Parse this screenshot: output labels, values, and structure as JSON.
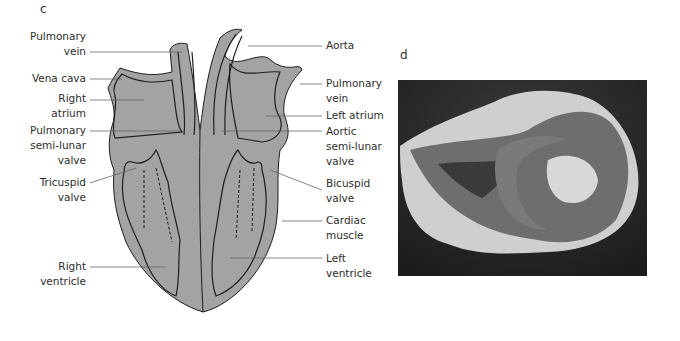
{
  "panels": {
    "c": {
      "letter": "c",
      "title": "Heart diagram (longitudinal section)",
      "labels_left": [
        {
          "id": "pulmonary-vein-left",
          "text": "Pulmonary\nvein"
        },
        {
          "id": "vena-cava",
          "text": "Vena cava"
        },
        {
          "id": "right-atrium",
          "text": "Right\natrium"
        },
        {
          "id": "pulmonary-semilunar-valve",
          "text": "Pulmonary\nsemi-lunar\nvalve"
        },
        {
          "id": "tricuspid-valve",
          "text": "Tricuspid\nvalve"
        },
        {
          "id": "right-ventricle",
          "text": "Right\nventricle"
        }
      ],
      "labels_right": [
        {
          "id": "aorta",
          "text": "Aorta"
        },
        {
          "id": "pulmonary-vein-right",
          "text": "Pulmonary\nvein"
        },
        {
          "id": "left-atrium",
          "text": "Left atrium"
        },
        {
          "id": "aortic-semilunar-valve",
          "text": "Aortic\nsemi-lunar\nvalve"
        },
        {
          "id": "bicuspid-valve",
          "text": "Bicuspid\nvalve"
        },
        {
          "id": "cardiac-muscle",
          "text": "Cardiac\nmuscle"
        },
        {
          "id": "left-ventricle",
          "text": "Left\nventricle"
        }
      ],
      "colors": {
        "tissue": "#a3a3a3",
        "outline": "#1e1e1e",
        "leader": "#555555"
      }
    },
    "d": {
      "letter": "d",
      "image": "Photograph of dissected heart section (black and white)"
    }
  }
}
